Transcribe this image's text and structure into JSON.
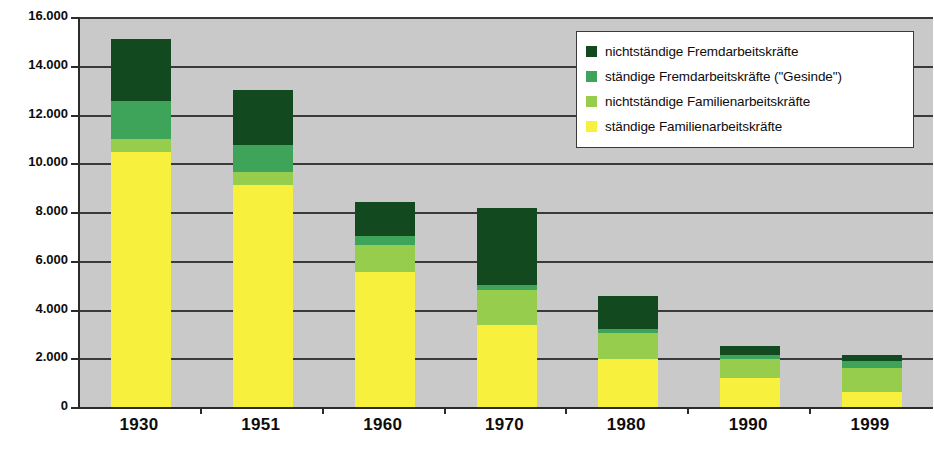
{
  "chart_data": {
    "type": "bar",
    "subtype": "stacked-bar",
    "title": "",
    "xlabel": "",
    "ylabel": "Anzahl der Personen",
    "ylim": [
      0,
      16000
    ],
    "ytick_step": 2000,
    "ytick_labels": [
      "16.000",
      "14.000",
      "12.000",
      "10.000",
      "8.000",
      "6.000",
      "4.000",
      "2.000",
      "0"
    ],
    "ytick_values": [
      16000,
      14000,
      12000,
      10000,
      8000,
      6000,
      4000,
      2000,
      0
    ],
    "grid": true,
    "grid_axis": "y",
    "legend_position": "top-right",
    "categories": [
      "1930",
      "1951",
      "1960",
      "1970",
      "1980",
      "1990",
      "1999"
    ],
    "series": [
      {
        "name": "ständige Familienarbeitskräfte",
        "color": "#f7f13e",
        "values": [
          10450,
          9100,
          5550,
          3350,
          1950,
          1200,
          600
        ]
      },
      {
        "name": "nichtständige Familienarbeitskräfte",
        "color": "#97cd4c",
        "values": [
          550,
          550,
          1100,
          1450,
          1100,
          750,
          1000
        ]
      },
      {
        "name": "ständige Fremdarbeitskräfte (\"Gesinde\")",
        "color": "#3da459",
        "values": [
          1550,
          1100,
          350,
          200,
          150,
          200,
          300
        ]
      },
      {
        "name": "nichtständige Fremdarbeitskräfte",
        "color": "#13491f",
        "values": [
          2550,
          2250,
          1400,
          3150,
          1350,
          350,
          250
        ]
      }
    ],
    "totals": [
      15100,
      13000,
      8400,
      8150,
      4550,
      2500,
      2150
    ]
  },
  "legend": {
    "entries": [
      {
        "label": "nichtständige Fremdarbeitskräfte",
        "color": "#13491f"
      },
      {
        "label": "ständige Fremdarbeitskräfte (\"Gesinde\")",
        "color": "#3da459"
      },
      {
        "label": "nichtständige Familienarbeitskräfte",
        "color": "#97cd4c"
      },
      {
        "label": "ständige Familienarbeitskräfte",
        "color": "#f7f13e"
      }
    ]
  },
  "axes": {
    "y_title": "Anzahl der Personen"
  },
  "style": {
    "plot_background": "#c9c9c9",
    "axis_color": "#2b2b2b",
    "grid_color": "#3a3a3a",
    "page_background": "#ffffff"
  }
}
